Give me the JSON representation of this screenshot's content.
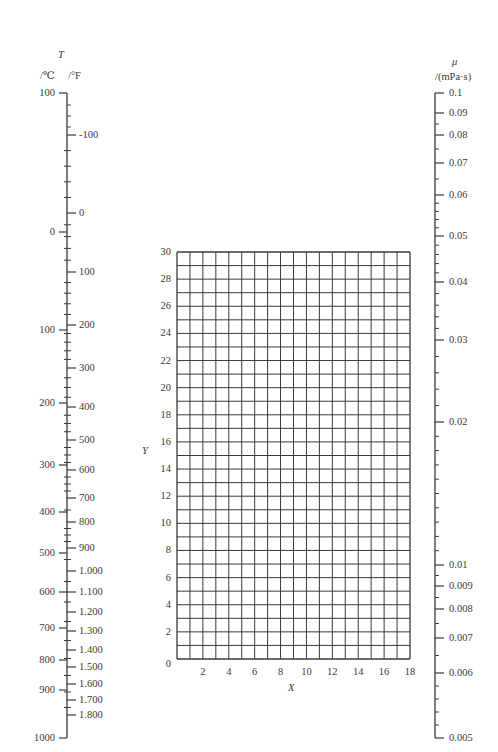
{
  "chart_data": {
    "type": "nomograph",
    "title": "",
    "left_scale": {
      "symbol": "T",
      "unit_c": "/℃",
      "unit_f": "/°F",
      "celsius_ticks": [
        "100",
        "0",
        "100",
        "200",
        "300",
        "400",
        "500",
        "600",
        "700",
        "800",
        "900",
        "1000"
      ],
      "celsius_values": [
        -100,
        0,
        100,
        200,
        300,
        400,
        500,
        600,
        700,
        800,
        900,
        1000
      ],
      "fahrenheit_ticks": [
        "-100",
        "0",
        "100",
        "200",
        "300",
        "400",
        "500",
        "600",
        "700",
        "800",
        "900",
        "1.000",
        "1.100",
        "1.200",
        "1.300",
        "1.400",
        "1.500",
        "1.600",
        "1.700",
        "1.800"
      ],
      "fahrenheit_values": [
        -100,
        0,
        100,
        200,
        300,
        400,
        500,
        600,
        700,
        800,
        900,
        1000,
        1100,
        1200,
        1300,
        1400,
        1500,
        1600,
        1700,
        1800
      ]
    },
    "right_scale": {
      "symbol": "μ",
      "unit": "/(mPa·s)",
      "scale": "log",
      "ticks": [
        "0.1",
        "0.09",
        "0.08",
        "0.07",
        "0.06",
        "0.05",
        "0.04",
        "0.03",
        "0.02",
        "0.01",
        "0.009",
        "0.008",
        "0.007",
        "0.006",
        "0.005"
      ],
      "values": [
        0.1,
        0.09,
        0.08,
        0.07,
        0.06,
        0.05,
        0.04,
        0.03,
        0.02,
        0.01,
        0.009,
        0.008,
        0.007,
        0.006,
        0.005
      ]
    },
    "grid": {
      "xlabel": "X",
      "ylabel": "Y",
      "xlim": [
        0,
        18
      ],
      "ylim": [
        0,
        30
      ],
      "x_ticks": [
        "2",
        "4",
        "6",
        "8",
        "10",
        "12",
        "14",
        "16",
        "18"
      ],
      "y_ticks": [
        "0",
        "2",
        "4",
        "6",
        "8",
        "10",
        "12",
        "14",
        "16",
        "18",
        "20",
        "22",
        "24",
        "26",
        "28",
        "30"
      ],
      "grid_on": true,
      "x_step": 1,
      "y_step": 1
    }
  }
}
